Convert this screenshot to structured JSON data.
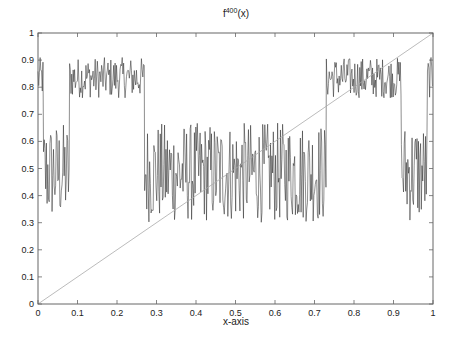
{
  "chart_data": {
    "type": "line",
    "title_base": "f",
    "title_sup": "400",
    "title_arg": "(x)",
    "xlabel": "x-axis",
    "ylabel": "",
    "xlim": [
      0,
      1
    ],
    "ylim": [
      0,
      1
    ],
    "xticks": [
      0,
      0.1,
      0.2,
      0.3,
      0.4,
      0.5,
      0.6,
      0.7,
      0.8,
      0.9,
      1
    ],
    "xtick_labels": [
      "0",
      "0.1",
      "0.2",
      "0.3",
      "0.4",
      "0.5",
      "0.6",
      "0.7",
      "0.8",
      "0.9",
      "1"
    ],
    "yticks": [
      0,
      0.1,
      0.2,
      0.3,
      0.4,
      0.5,
      0.6,
      0.7,
      0.8,
      0.9,
      1
    ],
    "ytick_labels": [
      "0",
      "0.1",
      "0.2",
      "0.3",
      "0.4",
      "0.5",
      "0.6",
      "0.7",
      "0.8",
      "0.9",
      "1"
    ],
    "grid": false,
    "legend": null,
    "series": [
      {
        "name": "f^400(x)",
        "style": "noisy chaotic band (dark gray)",
        "color": "#222222",
        "bands": [
          {
            "x_start": 0.0,
            "x_end": 0.014,
            "y_min": 0.76,
            "y_max": 0.91
          },
          {
            "x_start": 0.014,
            "x_end": 0.08,
            "y_min": 0.3,
            "y_max": 0.67
          },
          {
            "x_start": 0.08,
            "x_end": 0.27,
            "y_min": 0.76,
            "y_max": 0.91
          },
          {
            "x_start": 0.27,
            "x_end": 0.73,
            "y_min": 0.3,
            "y_max": 0.67
          },
          {
            "x_start": 0.73,
            "x_end": 0.92,
            "y_min": 0.76,
            "y_max": 0.91
          },
          {
            "x_start": 0.92,
            "x_end": 0.986,
            "y_min": 0.3,
            "y_max": 0.67
          },
          {
            "x_start": 0.986,
            "x_end": 1.0,
            "y_min": 0.76,
            "y_max": 0.91
          }
        ]
      },
      {
        "name": "y = x",
        "style": "thin light gray diagonal",
        "color": "#aaaaaa",
        "x": [
          0,
          1
        ],
        "y": [
          0,
          1
        ]
      }
    ]
  }
}
